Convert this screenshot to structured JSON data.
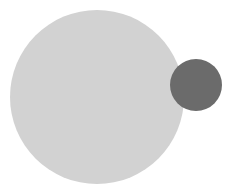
{
  "diagram": {
    "shapes": [
      {
        "name": "large-circle",
        "type": "circle",
        "cx": 97,
        "cy": 97,
        "r": 87,
        "color": "#d2d2d2"
      },
      {
        "name": "small-circle",
        "type": "circle",
        "cx": 196,
        "cy": 85,
        "r": 26,
        "color": "#6b6b6b"
      }
    ],
    "background": "#ffffff"
  }
}
